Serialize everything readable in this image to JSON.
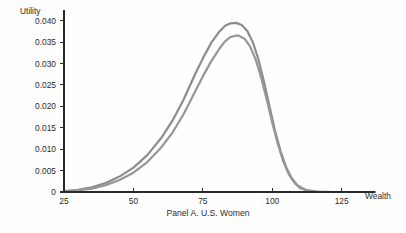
{
  "figure": {
    "caption": "Panel A. U.S. Women",
    "background_color": "#fefefe"
  },
  "chart_data": {
    "type": "line",
    "title": "",
    "subtitle": "",
    "caption": "Panel A. U.S. Women",
    "xlabel": "Wealth",
    "ylabel": "Utility",
    "xlim": [
      25,
      137
    ],
    "ylim": [
      0,
      0.0425
    ],
    "grid": false,
    "legend": null,
    "legend_position": "none",
    "x_ticks": [
      25,
      50,
      75,
      100,
      125
    ],
    "x_tick_labels": [
      "25",
      "50",
      "75",
      "100",
      "125"
    ],
    "y_ticks": [
      0,
      0.005,
      0.01,
      0.015,
      0.02,
      0.025,
      0.03,
      0.035,
      0.04
    ],
    "y_tick_labels": [
      "0",
      "0.005",
      "0.010",
      "0.015",
      "0.020",
      "0.025",
      "0.030",
      "0.035",
      "0.040"
    ],
    "axis_color": "#2a2a2a",
    "series": [
      {
        "name": "curve-upper",
        "color": "#8c8c8c",
        "width": 2.2,
        "peak_x": 87,
        "peak_y": 0.0395,
        "x": [
          25,
          30,
          35,
          40,
          45,
          50,
          55,
          60,
          64,
          68,
          72,
          75,
          78,
          81,
          83,
          85,
          87,
          89,
          91,
          93,
          95,
          97,
          99,
          101,
          103,
          105,
          107,
          109,
          112,
          116,
          122,
          130,
          137
        ],
        "values": [
          0.0002,
          0.0005,
          0.0011,
          0.0021,
          0.0036,
          0.0057,
          0.0086,
          0.0126,
          0.0166,
          0.0215,
          0.0272,
          0.0312,
          0.0348,
          0.0375,
          0.0388,
          0.0394,
          0.0395,
          0.039,
          0.0376,
          0.035,
          0.031,
          0.0258,
          0.02,
          0.0143,
          0.0095,
          0.0058,
          0.0032,
          0.0016,
          0.0005,
          0.0001,
          0.0,
          0.0,
          0.0
        ]
      },
      {
        "name": "curve-lower",
        "color": "#979797",
        "width": 2.2,
        "peak_x": 88,
        "peak_y": 0.0365,
        "x": [
          25,
          30,
          35,
          40,
          45,
          50,
          55,
          60,
          64,
          68,
          72,
          75,
          78,
          81,
          83,
          85,
          87,
          88,
          90,
          92,
          94,
          96,
          98,
          100,
          102,
          104,
          106,
          108,
          110,
          113,
          117,
          123,
          130,
          137
        ],
        "values": [
          0.0001,
          0.0004,
          0.0008,
          0.0016,
          0.0028,
          0.0045,
          0.007,
          0.0104,
          0.0138,
          0.0181,
          0.0232,
          0.027,
          0.0305,
          0.0335,
          0.0352,
          0.0362,
          0.0365,
          0.0365,
          0.0358,
          0.034,
          0.031,
          0.0267,
          0.0216,
          0.0162,
          0.0112,
          0.0071,
          0.0041,
          0.0021,
          0.0009,
          0.0003,
          0.0,
          0.0,
          0.0,
          0.0
        ]
      }
    ]
  }
}
